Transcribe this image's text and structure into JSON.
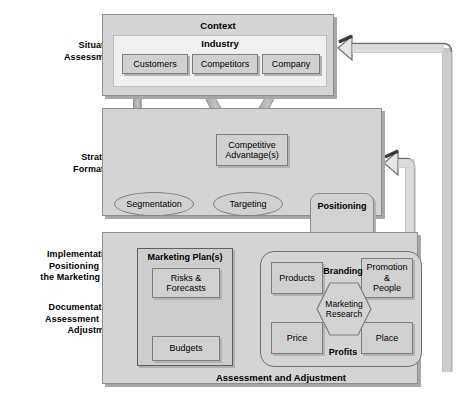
{
  "diagram": {
    "colors": {
      "panel_fill": "#d4d4d4",
      "industry_fill": "#f0f0f0",
      "node_fill": "#d0d0d0",
      "border": "#7d7d7d",
      "arrow_fill": "#d9d9d9",
      "arrow_stroke": "#6e6e6e",
      "text": "#000000"
    },
    "stage_labels": [
      {
        "name": "situation-assessment",
        "text": "Situation\nAssessment"
      },
      {
        "name": "strategy-formation",
        "text": "Strategy\nFormation"
      },
      {
        "name": "implementation",
        "text": "Implementation:\nPositioning and\nthe Marketing Mix"
      },
      {
        "name": "documentation",
        "text": "Documentation,\nAssessment and\nAdjustment"
      }
    ],
    "sidebar": {
      "situation_line1": "Situation",
      "situation_line2": "Assessment",
      "strategy_line1": "Strategy",
      "strategy_line2": "Formation",
      "implementation_line1": "Implementation:",
      "implementation_line2": "Positioning and",
      "implementation_line3": "the Marketing Mix",
      "documentation_line1": "Documentation,",
      "documentation_line2": "Assessment and",
      "documentation_line3": "Adjustment"
    },
    "context_panel": {
      "title": "Context",
      "industry_title": "Industry",
      "nodes": [
        {
          "name": "customers",
          "label": "Customers"
        },
        {
          "name": "competitors",
          "label": "Competitors"
        },
        {
          "name": "company",
          "label": "Company"
        }
      ]
    },
    "strategy_panel": {
      "competitive_advantage_line1": "Competitive",
      "competitive_advantage_line2": "Advantage(s)",
      "segmentation": "Segmentation",
      "targeting": "Targeting",
      "positioning": "Positioning"
    },
    "implementation_panel": {
      "marketing_plan_title": "Marketing Plan(s)",
      "risks_line1": "Risks &",
      "risks_line2": "Forecasts",
      "budgets": "Budgets",
      "mix": {
        "products": "Products",
        "price": "Price",
        "promotion_line1": "Promotion",
        "promotion_line2": "&",
        "promotion_line3": "People",
        "place": "Place",
        "branding": "Branding",
        "profits": "Profits",
        "research_line1": "Marketing",
        "research_line2": "Research"
      },
      "footer": "Assessment and Adjustment"
    },
    "feedback_arrows": [
      {
        "name": "feedback-to-context",
        "from": "assessment-and-adjustment",
        "to": "context-panel"
      },
      {
        "name": "feedback-to-strategy",
        "from": "assessment-and-adjustment",
        "to": "strategy-panel"
      }
    ]
  }
}
